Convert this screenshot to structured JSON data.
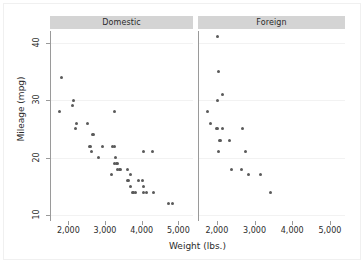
{
  "chart_data": {
    "type": "scatter",
    "title": "",
    "xlabel": "Weight (lbs.)",
    "ylabel": "Mileage (mpg)",
    "xlim": [
      1500,
      5400
    ],
    "ylim": [
      9,
      42
    ],
    "xticks": [
      2000,
      3000,
      4000,
      5000
    ],
    "xtick_labels": [
      "2,000",
      "3,000",
      "4,000",
      "5,000"
    ],
    "yticks": [
      10,
      20,
      30,
      40
    ],
    "ytick_labels": [
      "10",
      "20",
      "30",
      "40"
    ],
    "grid": "horizontal",
    "legend": "none",
    "facet_by": "Car origin",
    "marker_color": "#5a5a5a",
    "header_color": "#d4d4d4",
    "axis_color": "#9a9a9a",
    "gridline_color": "#f2f2f2",
    "panels": [
      {
        "label": "Domestic",
        "points": [
          {
            "x": 1800,
            "y": 34
          },
          {
            "x": 1760,
            "y": 28
          },
          {
            "x": 2130,
            "y": 30
          },
          {
            "x": 2110,
            "y": 29
          },
          {
            "x": 2230,
            "y": 26
          },
          {
            "x": 2200,
            "y": 25
          },
          {
            "x": 2520,
            "y": 26
          },
          {
            "x": 2650,
            "y": 24
          },
          {
            "x": 2690,
            "y": 24
          },
          {
            "x": 2580,
            "y": 22
          },
          {
            "x": 2600,
            "y": 22
          },
          {
            "x": 2640,
            "y": 21
          },
          {
            "x": 2830,
            "y": 20
          },
          {
            "x": 2930,
            "y": 22
          },
          {
            "x": 3250,
            "y": 28
          },
          {
            "x": 3200,
            "y": 22
          },
          {
            "x": 3260,
            "y": 22
          },
          {
            "x": 3250,
            "y": 19
          },
          {
            "x": 3280,
            "y": 20
          },
          {
            "x": 3300,
            "y": 19
          },
          {
            "x": 3330,
            "y": 19
          },
          {
            "x": 3170,
            "y": 17
          },
          {
            "x": 3350,
            "y": 18
          },
          {
            "x": 3400,
            "y": 18
          },
          {
            "x": 3420,
            "y": 18
          },
          {
            "x": 3600,
            "y": 18
          },
          {
            "x": 3600,
            "y": 16
          },
          {
            "x": 3630,
            "y": 16
          },
          {
            "x": 3700,
            "y": 17
          },
          {
            "x": 3690,
            "y": 15
          },
          {
            "x": 3740,
            "y": 14
          },
          {
            "x": 3780,
            "y": 14
          },
          {
            "x": 3830,
            "y": 14
          },
          {
            "x": 3900,
            "y": 16
          },
          {
            "x": 4030,
            "y": 16
          },
          {
            "x": 4060,
            "y": 15
          },
          {
            "x": 4060,
            "y": 21
          },
          {
            "x": 4290,
            "y": 21
          },
          {
            "x": 4060,
            "y": 14
          },
          {
            "x": 4130,
            "y": 14
          },
          {
            "x": 4330,
            "y": 14
          },
          {
            "x": 4720,
            "y": 12
          },
          {
            "x": 4840,
            "y": 12
          }
        ]
      },
      {
        "label": "Foreign",
        "points": [
          {
            "x": 2020,
            "y": 41
          },
          {
            "x": 2040,
            "y": 35
          },
          {
            "x": 2160,
            "y": 31
          },
          {
            "x": 2020,
            "y": 30
          },
          {
            "x": 1760,
            "y": 28
          },
          {
            "x": 1830,
            "y": 26
          },
          {
            "x": 1990,
            "y": 25
          },
          {
            "x": 2030,
            "y": 25
          },
          {
            "x": 2150,
            "y": 25
          },
          {
            "x": 2670,
            "y": 25
          },
          {
            "x": 2070,
            "y": 23
          },
          {
            "x": 2110,
            "y": 23
          },
          {
            "x": 2330,
            "y": 23
          },
          {
            "x": 2050,
            "y": 21
          },
          {
            "x": 2750,
            "y": 21
          },
          {
            "x": 2390,
            "y": 18
          },
          {
            "x": 2650,
            "y": 18
          },
          {
            "x": 2830,
            "y": 17
          },
          {
            "x": 3170,
            "y": 17
          },
          {
            "x": 3420,
            "y": 14
          }
        ]
      }
    ]
  }
}
